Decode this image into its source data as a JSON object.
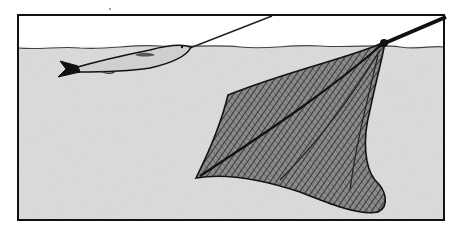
{
  "illustration": {
    "description": "Fish on a line being guided over a landing net submerged in water",
    "colors": {
      "background": "#ffffff",
      "sky": "#ffffff",
      "water": "#dcdcdc",
      "ink": "#111111",
      "net_fill": "#6e6e6e",
      "fish_body": "#cfcfcf"
    }
  }
}
